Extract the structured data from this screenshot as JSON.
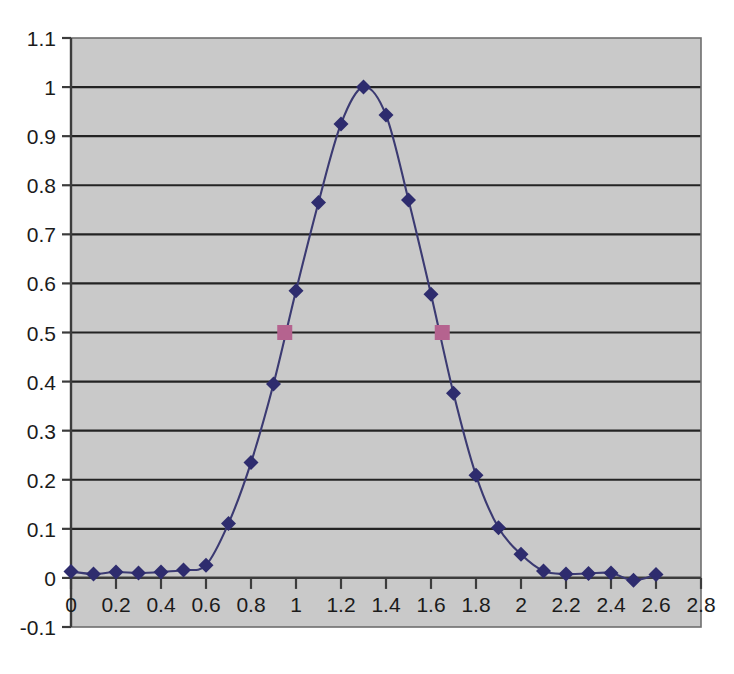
{
  "chart_data": {
    "type": "line",
    "title": "",
    "subtitle": "",
    "xlabel": "",
    "ylabel": "",
    "xlim": [
      0,
      2.8
    ],
    "ylim": [
      -0.1,
      1.1
    ],
    "grid": true,
    "grid_axis": "y",
    "legend": false,
    "legend_position": "none",
    "plot_background_color": "#c9c9c9",
    "page_background_color": "#ffffff",
    "x_tick_labels": [
      "0",
      "0.2",
      "0.4",
      "0.6",
      "0.8",
      "1",
      "1.2",
      "1.4",
      "1.6",
      "1.8",
      "2",
      "2.2",
      "2.4",
      "2.6",
      "2.8"
    ],
    "x_tick_values": [
      0,
      0.2,
      0.4,
      0.6,
      0.8,
      1.0,
      1.2,
      1.4,
      1.6,
      1.8,
      2.0,
      2.2,
      2.4,
      2.6,
      2.8
    ],
    "y_tick_labels": [
      "1.1",
      "1",
      "0.9",
      "0.8",
      "0.7",
      "0.6",
      "0.5",
      "0.4",
      "0.3",
      "0.2",
      "0.1",
      "0",
      "-0.1"
    ],
    "y_tick_values": [
      1.1,
      1.0,
      0.9,
      0.8,
      0.7,
      0.6,
      0.5,
      0.4,
      0.3,
      0.2,
      0.1,
      0.0,
      -0.1
    ],
    "series": [
      {
        "name": "curve",
        "marker": "diamond",
        "marker_color": "#2e2c6e",
        "line_color": "#3b3a72",
        "x": [
          0,
          0.1,
          0.2,
          0.3,
          0.4,
          0.5,
          0.6,
          0.7,
          0.8,
          0.9,
          1.0,
          1.1,
          1.2,
          1.3,
          1.4,
          1.5,
          1.6,
          1.7,
          1.8,
          1.9,
          2.0,
          2.1,
          2.2,
          2.3,
          2.4,
          2.5,
          2.6
        ],
        "values": [
          0.013,
          0.008,
          0.012,
          0.01,
          0.012,
          0.016,
          0.026,
          0.111,
          0.235,
          0.395,
          0.585,
          0.765,
          0.925,
          1.0,
          0.943,
          0.77,
          0.578,
          0.376,
          0.209,
          0.102,
          0.048,
          0.014,
          0.008,
          0.009,
          0.01,
          -0.005,
          0.007
        ]
      },
      {
        "name": "half-max-markers",
        "marker": "square",
        "marker_color": "#b5638f",
        "x": [
          0.95,
          1.65
        ],
        "values": [
          0.5,
          0.5
        ]
      }
    ]
  }
}
